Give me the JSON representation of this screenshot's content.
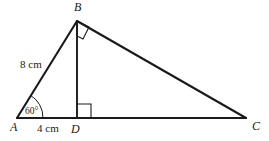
{
  "figure": {
    "background_color": "#ffffff",
    "stroke_color": "#1a1a1a",
    "vertices": {
      "A": {
        "label": "A",
        "x": 17,
        "y": 118,
        "label_x": 10,
        "label_y": 131
      },
      "B": {
        "label": "B",
        "x": 77,
        "y": 21,
        "label_x": 74,
        "label_y": 11
      },
      "C": {
        "label": "C",
        "x": 246,
        "y": 118,
        "label_x": 252,
        "label_y": 130
      },
      "D": {
        "label": "D",
        "x": 77,
        "y": 118,
        "label_x": 73,
        "label_y": 132
      }
    },
    "segments": [
      {
        "name": "side-AB",
        "from": "A",
        "to": "B"
      },
      {
        "name": "side-BC",
        "from": "B",
        "to": "C"
      },
      {
        "name": "side-AC",
        "from": "A",
        "to": "C"
      },
      {
        "name": "altitude-BD",
        "from": "B",
        "to": "D"
      }
    ],
    "measurements": [
      {
        "name": "length-AB",
        "text": "8 cm",
        "x": 21,
        "y": 68,
        "segment": "AB"
      },
      {
        "name": "length-AD",
        "text": "4 cm",
        "x": 38,
        "y": 132,
        "segment": "AD"
      }
    ],
    "angles": [
      {
        "name": "angle-A",
        "text": "60°",
        "vertex": "A",
        "label_x": 24,
        "label_y": 114,
        "marker": "arc",
        "radius": 26
      },
      {
        "name": "angle-B",
        "text": "",
        "vertex": "B",
        "marker": "right-angle-square",
        "between": [
          "BD",
          "BC"
        ]
      },
      {
        "name": "angle-D",
        "text": "",
        "vertex": "D",
        "marker": "right-angle-square",
        "between": [
          "DB",
          "DC"
        ]
      }
    ]
  }
}
